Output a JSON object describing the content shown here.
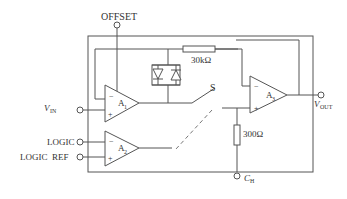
{
  "diagram": {
    "type": "sample-and-hold circuit schematic",
    "labels": {
      "offset": "OFFSET",
      "vin_main": "V",
      "vin_sub": "IN",
      "vout_main": "V",
      "vout_sub": "OUT",
      "logic": "LOGIC",
      "logic_ref": "LOGIC  REF",
      "ch_main": "C",
      "ch_sub": "H",
      "switch": "S",
      "r1": "30kΩ",
      "r2": "300Ω"
    },
    "amplifiers": [
      {
        "main": "A",
        "sub": "1"
      },
      {
        "main": "A",
        "sub": "2"
      },
      {
        "main": "A",
        "sub": "3"
      }
    ],
    "signs": {
      "minus": "−",
      "plus": "+"
    }
  }
}
